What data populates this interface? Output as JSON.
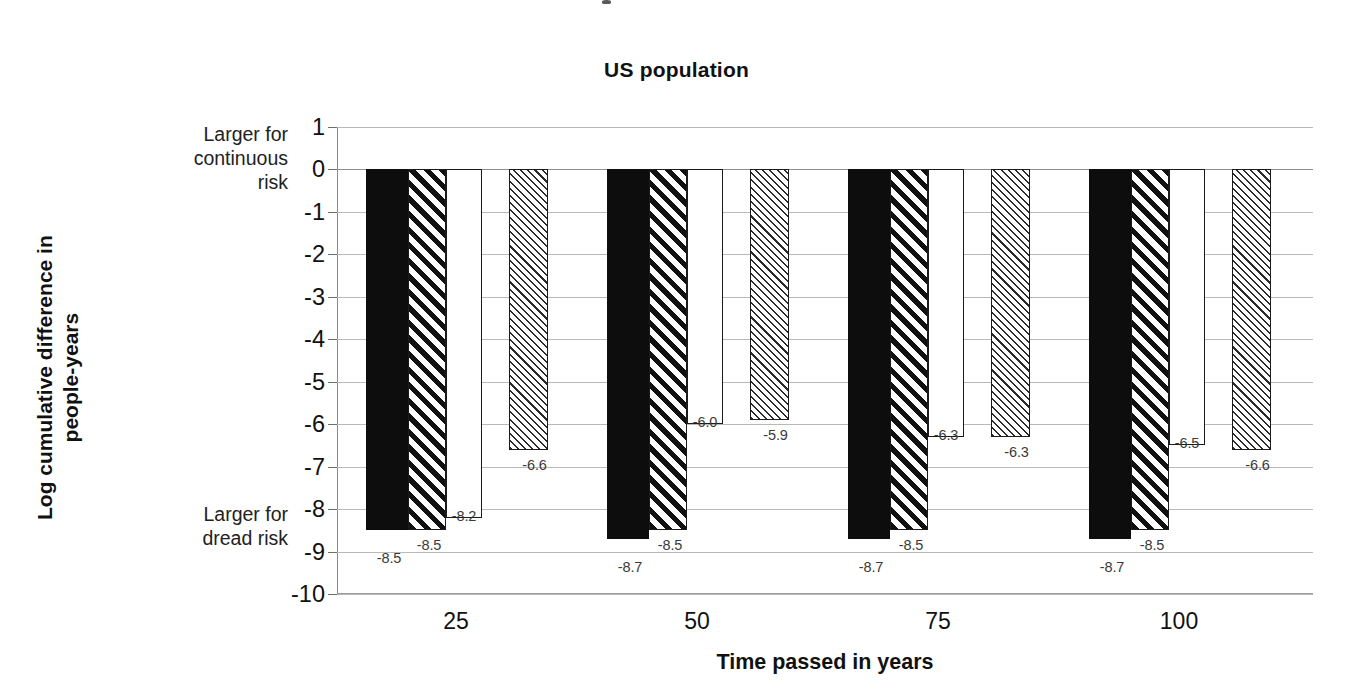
{
  "chart_data": {
    "type": "bar",
    "title": "US population",
    "xlabel": "Time passed in years",
    "ylabel": "Log cumulative difference in people-years",
    "categories": [
      "25",
      "50",
      "75",
      "100"
    ],
    "series": [
      {
        "name": "series-1-solid-black",
        "pattern": "solid-black",
        "values": [
          -8.5,
          -8.7,
          -8.7,
          -8.7
        ]
      },
      {
        "name": "series-2-bold-diagonal-hatch",
        "pattern": "bold-diagonal-hatch",
        "values": [
          -8.5,
          -8.5,
          -8.5,
          -8.5
        ]
      },
      {
        "name": "series-3-plain-white",
        "pattern": "plain-white",
        "values": [
          -8.2,
          -6.0,
          -6.3,
          -6.5
        ]
      },
      {
        "name": "series-4-fine-diagonal-hatch",
        "pattern": "fine-diagonal-hatch",
        "values": [
          -6.6,
          -5.9,
          -6.3,
          -6.6
        ]
      }
    ],
    "ylim": [
      -10,
      1
    ],
    "yticks": [
      1,
      0,
      -1,
      -2,
      -3,
      -4,
      -5,
      -6,
      -7,
      -8,
      -9,
      -10
    ],
    "ytick_labels": [
      "1",
      "0",
      "-1",
      "-2",
      "-3",
      "-4",
      "-5",
      "-6",
      "-7",
      "-8",
      "-9",
      "-10"
    ],
    "grid": true,
    "legend": "none",
    "annotations": {
      "top": "Larger for continuous risk",
      "top_lines": [
        "Larger for",
        "continuous",
        "risk"
      ],
      "bottom": "Larger for dread risk",
      "bottom_lines": [
        "Larger for",
        "dread risk"
      ]
    },
    "data_labels": [
      [
        "-8.5",
        "-8.5",
        "-8.2",
        "-6.6"
      ],
      [
        "-8.7",
        "-8.5",
        "-6.0",
        "-5.9"
      ],
      [
        "-8.7",
        "-8.5",
        "-6.3",
        "-6.3"
      ],
      [
        "-8.7",
        "-8.5",
        "-6.5",
        "-6.6"
      ]
    ],
    "colors": {
      "bar_fill_solid": "#0d0d0d",
      "bar_outline": "#1b1b1b",
      "gridline": "#b9b9b9",
      "axis": "#8a8a8a",
      "text": "#111111",
      "data_label_text": "#3a3a3a",
      "background": "#ffffff"
    }
  },
  "y_axis_title_lines": [
    "Log cumulative difference in",
    "people-years"
  ]
}
